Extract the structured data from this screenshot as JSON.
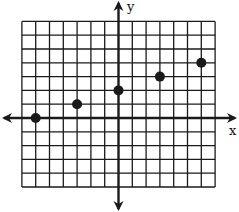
{
  "chart_data": {
    "type": "scatter",
    "title": "",
    "xlabel": "x",
    "ylabel": "y",
    "xlim": [
      -7,
      7
    ],
    "ylim": [
      -5,
      7
    ],
    "grid": true,
    "grid_step": 1,
    "points": [
      {
        "x": -6,
        "y": 0
      },
      {
        "x": -3,
        "y": 1
      },
      {
        "x": 0,
        "y": 2
      },
      {
        "x": 3,
        "y": 3
      },
      {
        "x": 6,
        "y": 4
      }
    ],
    "x_values": [
      -6,
      -3,
      0,
      3,
      6
    ],
    "y_values": [
      0,
      1,
      2,
      3,
      4
    ],
    "colors": {
      "ink": "#1a1a1a",
      "background": "#ffffff"
    }
  },
  "labels": {
    "x_axis": "x",
    "y_axis": "y"
  }
}
